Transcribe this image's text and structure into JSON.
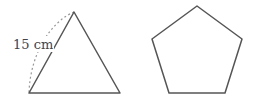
{
  "figure": {
    "triangle": {
      "type": "equilateral-triangle",
      "side_label": "15 cm",
      "points": [
        [
          74,
          12
        ],
        [
          29,
          93
        ],
        [
          120,
          93
        ]
      ]
    },
    "pentagon": {
      "type": "regular-pentagon",
      "points": [
        [
          197,
          6
        ],
        [
          242,
          39
        ],
        [
          225,
          93
        ],
        [
          169,
          93
        ],
        [
          152,
          39
        ]
      ]
    },
    "colors": {
      "stroke": "#555555",
      "dashed": "#999999",
      "label": "#444444"
    }
  }
}
